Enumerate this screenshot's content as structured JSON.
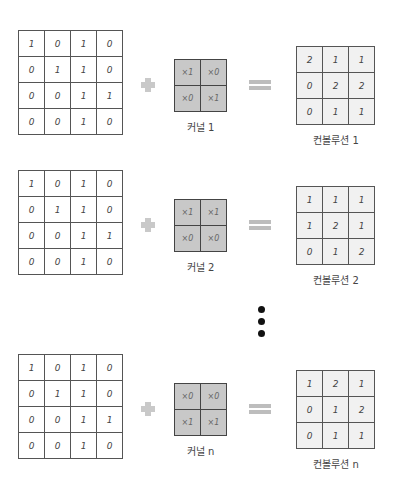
{
  "rows": [
    {
      "input": [
        [
          "1",
          "0",
          "1",
          "0"
        ],
        [
          "0",
          "1",
          "1",
          "0"
        ],
        [
          "0",
          "0",
          "1",
          "1"
        ],
        [
          "0",
          "0",
          "1",
          "0"
        ]
      ],
      "kernel": [
        [
          "×1",
          "×0"
        ],
        [
          "×0",
          "×1"
        ]
      ],
      "kernel_label": "커널 1",
      "result": [
        [
          "2",
          "1",
          "1"
        ],
        [
          "0",
          "2",
          "2"
        ],
        [
          "0",
          "1",
          "1"
        ]
      ],
      "result_label": "컨볼루션 1"
    },
    {
      "input": [
        [
          "1",
          "0",
          "1",
          "0"
        ],
        [
          "0",
          "1",
          "1",
          "0"
        ],
        [
          "0",
          "0",
          "1",
          "1"
        ],
        [
          "0",
          "0",
          "1",
          "0"
        ]
      ],
      "kernel": [
        [
          "×1",
          "×1"
        ],
        [
          "×0",
          "×0"
        ]
      ],
      "kernel_label": "커널 2",
      "result": [
        [
          "1",
          "1",
          "1"
        ],
        [
          "1",
          "2",
          "1"
        ],
        [
          "0",
          "1",
          "2"
        ]
      ],
      "result_label": "컨볼루션 2"
    },
    {
      "input": [
        [
          "1",
          "0",
          "1",
          "0"
        ],
        [
          "0",
          "1",
          "1",
          "0"
        ],
        [
          "0",
          "0",
          "1",
          "1"
        ],
        [
          "0",
          "0",
          "1",
          "0"
        ]
      ],
      "kernel": [
        [
          "×0",
          "×0"
        ],
        [
          "×1",
          "×1"
        ]
      ],
      "kernel_label": "커널 n",
      "result": [
        [
          "1",
          "2",
          "1"
        ],
        [
          "0",
          "1",
          "2"
        ],
        [
          "0",
          "1",
          "1"
        ]
      ],
      "result_label": "컨볼루션 n"
    }
  ],
  "operators": {
    "plus": "+",
    "equals": "="
  },
  "ellipsis": "⋮",
  "colors": {
    "kernel_fill": "#c8c8c8",
    "result_fill": "#f1f1f1",
    "operator": "#c4c4c4"
  }
}
